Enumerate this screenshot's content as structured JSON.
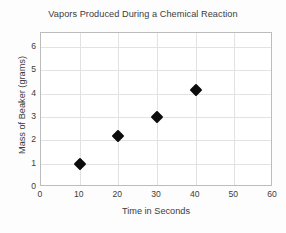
{
  "chart_data": {
    "type": "scatter",
    "title": "Vapors Produced During a Chemical Reaction",
    "xlabel": "Time in Seconds",
    "ylabel": "Mass of Beaker (grams)",
    "x": [
      10,
      20,
      30,
      40
    ],
    "values": [
      1.0,
      2.2,
      3.0,
      4.15
    ],
    "points": [
      {
        "x": 10,
        "y": 1.0
      },
      {
        "x": 20,
        "y": 2.2
      },
      {
        "x": 30,
        "y": 3.0
      },
      {
        "x": 40,
        "y": 4.15
      }
    ],
    "xlim": [
      0,
      60
    ],
    "ylim": [
      0,
      6.6
    ],
    "xticks": [
      0,
      10,
      20,
      30,
      40,
      50,
      60
    ],
    "yticks": [
      0,
      1,
      2,
      3,
      4,
      5,
      6
    ],
    "xtick_labels": [
      "0",
      "10",
      "20",
      "30",
      "40",
      "50",
      "60"
    ],
    "ytick_labels": [
      "0",
      "1",
      "2",
      "3",
      "4",
      "5",
      "6"
    ],
    "grid": true,
    "legend": null,
    "marker": "diamond",
    "marker_color": "#0d0d0d",
    "grid_color": "#e2e2e2",
    "frame_color": "#bcbcbc",
    "background": "#ffffff"
  }
}
